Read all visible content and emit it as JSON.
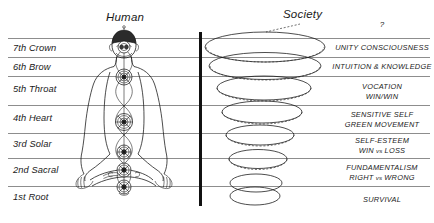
{
  "headers": {
    "left": "Human",
    "right": "Society"
  },
  "top_marker": "?",
  "chakras": [
    {
      "id": "crown",
      "label": "7th Crown"
    },
    {
      "id": "brow",
      "label": "6th Brow"
    },
    {
      "id": "throat",
      "label": "5th Throat"
    },
    {
      "id": "heart",
      "label": "4th Heart"
    },
    {
      "id": "solar",
      "label": "3rd Solar"
    },
    {
      "id": "sacral",
      "label": "2nd Sacral"
    },
    {
      "id": "root",
      "label": "1st Root"
    }
  ],
  "society_levels": [
    {
      "id": "unity",
      "line1": "UNITY CONSCIOUSNESS",
      "line2": ""
    },
    {
      "id": "intuition",
      "line1": "INTUITION & KNOWLEDGE",
      "line2": ""
    },
    {
      "id": "vocation",
      "line1": "VOCATION",
      "line2": "WIN/WIN"
    },
    {
      "id": "sensitive-self",
      "line1": "SENSITIVE SELF",
      "line2": "GREEN MOVEMENT"
    },
    {
      "id": "self-esteem",
      "line1": "SELF-ESTEEM",
      "line2_pre": "WIN ",
      "line2_vs": "vs",
      "line2_post": " LOSS"
    },
    {
      "id": "fundamentalism",
      "line1": "FUNDAMENTALISM",
      "line2_pre": "RIGHT ",
      "line2_vs": "vs",
      "line2_post": " WRONG"
    },
    {
      "id": "survival",
      "line1": "SURVIVAL",
      "line2": ""
    }
  ],
  "colors": {
    "rule": "#8d8d8d",
    "divider": "#111111",
    "ink": "#1a1a1a",
    "crown_cap": "#2b2b2b"
  }
}
